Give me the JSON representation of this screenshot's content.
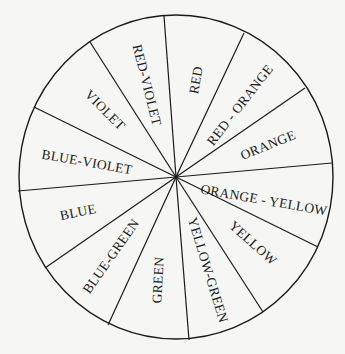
{
  "diagram": {
    "colors": {
      "background": "#f6f6f5",
      "stroke": "#1a1a1a"
    },
    "center": [
      176,
      177
    ],
    "radius": {
      "rx": 157,
      "ry": 162
    },
    "sector_boundaries": [
      [
        164,
        16
      ],
      [
        244,
        33
      ],
      [
        305,
        88
      ],
      [
        332,
        163
      ],
      [
        318,
        247
      ],
      [
        263,
        312
      ],
      [
        189,
        340
      ],
      [
        108,
        325
      ],
      [
        45,
        268
      ],
      [
        18,
        191
      ],
      [
        34,
        107
      ],
      [
        90,
        42
      ]
    ],
    "sectors": [
      {
        "label": "RED",
        "x": 196,
        "y": 80,
        "rotate": -80
      },
      {
        "label": "RED - ORANGE",
        "x": 240,
        "y": 105,
        "rotate": -52
      },
      {
        "label": "ORANGE",
        "x": 268,
        "y": 145,
        "rotate": -22
      },
      {
        "label": "ORANGE - YELLOW",
        "x": 264,
        "y": 200,
        "rotate": 10
      },
      {
        "label": "YELLOW",
        "x": 253,
        "y": 243,
        "rotate": 42
      },
      {
        "label": "YELLOW-GREEN",
        "x": 208,
        "y": 270,
        "rotate": 73
      },
      {
        "label": "GREEN",
        "x": 158,
        "y": 280,
        "rotate": -87
      },
      {
        "label": "BLUE-GREEN",
        "x": 111,
        "y": 256,
        "rotate": -55
      },
      {
        "label": "BLUE",
        "x": 78,
        "y": 212,
        "rotate": -12
      },
      {
        "label": "BLUE-VIOLET",
        "x": 87,
        "y": 162,
        "rotate": 10
      },
      {
        "label": "VIOLET",
        "x": 105,
        "y": 110,
        "rotate": 45
      },
      {
        "label": "RED-VIOLET",
        "x": 147,
        "y": 85,
        "rotate": 76
      }
    ]
  }
}
